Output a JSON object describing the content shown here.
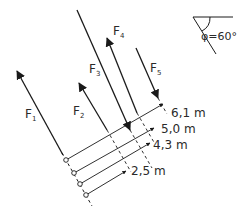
{
  "diagram": {
    "angle_label": "φ=60°",
    "forces": [
      {
        "name": "F",
        "sub": "1"
      },
      {
        "name": "F",
        "sub": "2"
      },
      {
        "name": "F",
        "sub": "3"
      },
      {
        "name": "F",
        "sub": "4"
      },
      {
        "name": "F",
        "sub": "5"
      }
    ],
    "distances": [
      {
        "label": "6,1 m"
      },
      {
        "label": "5,0 m"
      },
      {
        "label": "4,3 m"
      },
      {
        "label": "2,5 m"
      }
    ],
    "colors": {
      "line": "#1a1a1a",
      "text": "#2a2a2a",
      "background": "#ffffff"
    }
  }
}
